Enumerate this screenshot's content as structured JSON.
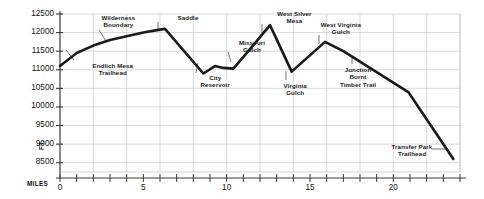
{
  "chart_data": {
    "type": "line",
    "title": "",
    "xlabel": "MILES",
    "ylabel": "FT.",
    "xlim": [
      0,
      24
    ],
    "ylim": [
      8250,
      12500
    ],
    "grid": true,
    "legend": "none",
    "x_ticks_major": [
      0,
      5,
      10,
      15,
      20
    ],
    "x_tick_labels": [
      "0",
      "5",
      "10",
      "15",
      "20"
    ],
    "x_tick_interval_minor": 1,
    "y_ticks": [
      8500,
      9000,
      9500,
      10000,
      10500,
      11000,
      11500,
      12000,
      12500
    ],
    "y_tick_labels": [
      "8500",
      "9000",
      "9500",
      "10000",
      "10500",
      "11000",
      "11500",
      "12000",
      "12500"
    ],
    "series": [
      {
        "name": "Elevation profile",
        "color": "#1a1a1a",
        "x": [
          0,
          1,
          2,
          3,
          4,
          5,
          6,
          6.3,
          8.6,
          9.3,
          9.8,
          10.4,
          11.3,
          12.6,
          13.9,
          15.9,
          17.0,
          20.9,
          23.6
        ],
        "y": [
          11100,
          11450,
          11650,
          11800,
          11900,
          12000,
          12080,
          12100,
          10900,
          11100,
          11050,
          11030,
          11500,
          12200,
          10950,
          11750,
          11500,
          10400,
          8600
        ]
      }
    ],
    "annotations": [
      {
        "label": "Wilderness\nBoundary",
        "x_pct": 14.6,
        "y_px": 14,
        "leader": true
      },
      {
        "label": "Endlich Mesa\nTrailhead",
        "x_pct": 13.2,
        "y_px": 62,
        "leader": true
      },
      {
        "label": "Saddle",
        "x_pct": 32.0,
        "y_px": 14,
        "leader": true
      },
      {
        "label": "City\nReservoir",
        "x_pct": 38.8,
        "y_px": 74,
        "leader": true
      },
      {
        "label": "Missouri\nGulch",
        "x_pct": 48.0,
        "y_px": 39,
        "leader": true
      },
      {
        "label": "West Silver\nMesa",
        "x_pct": 58.6,
        "y_px": 10,
        "leader": true
      },
      {
        "label": "Virginia\nGulch",
        "x_pct": 58.8,
        "y_px": 82,
        "leader": true
      },
      {
        "label": "West Virginia\nGulch",
        "x_pct": 70.2,
        "y_px": 21,
        "leader": true
      },
      {
        "label": "Junction\nBurnt\nTimber Trail",
        "x_pct": 74.5,
        "y_px": 66,
        "leader": true
      },
      {
        "label": "Transfer Park\nTrailhead",
        "x_pct": 88.0,
        "y_px": 143,
        "leader": true
      }
    ]
  },
  "axes": {
    "y_title": "FT.",
    "x_title": "MILES"
  },
  "colors": {
    "line": "#1a1a1a",
    "grid": "#c9c9c9",
    "axis": "#555555",
    "text": "#111111"
  }
}
